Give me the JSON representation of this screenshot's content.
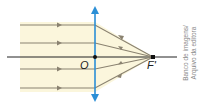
{
  "diagram": {
    "labels": {
      "optical_center": "O",
      "focus": "F'"
    },
    "credit": {
      "line1": "Banco de imagens/",
      "line2": "Arquivo da editora"
    },
    "colors": {
      "lens": "#2b8fd6",
      "rays": "#8a8270",
      "axis": "#222222",
      "background_fill": "#fbf6dc"
    },
    "rays": [
      {
        "y": 25
      },
      {
        "y": 43
      },
      {
        "y": 69
      },
      {
        "y": 88
      }
    ]
  }
}
